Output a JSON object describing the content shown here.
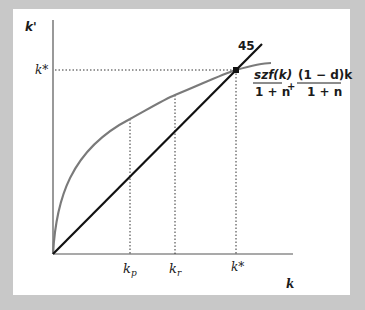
{
  "diagram": {
    "title": "",
    "y_axis_label": "k'",
    "x_axis_label": "k",
    "steady_state_y_label": "k*",
    "line_label": "45",
    "curve_label": {
      "term1_numerator": "szf(k)",
      "term1_denominator": "1 + n",
      "operator": "+",
      "term2_numerator": "(1 − d)k",
      "term2_denominator": "1 + n"
    },
    "x_ticks": [
      {
        "label": "k",
        "sub": "p"
      },
      {
        "label": "k",
        "sub": "r"
      },
      {
        "label": "k*",
        "sub": ""
      }
    ],
    "colors": {
      "background": "#c8c8c8",
      "panel": "#ffffff",
      "line_45": "#111111",
      "curve": "#7a7a7a",
      "axes": "#555555"
    }
  }
}
